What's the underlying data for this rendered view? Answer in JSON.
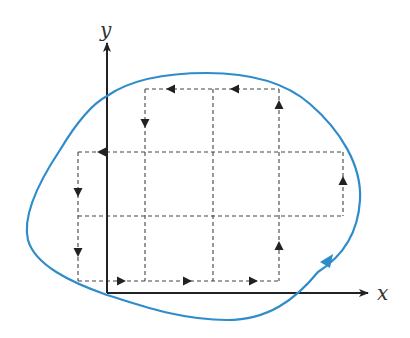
{
  "diagram": {
    "type": "closed-curve-with-grid-circulation",
    "colors": {
      "curve": "#2e8ccb",
      "axes": "#222222",
      "grid": "#444444",
      "arrows": "#222222",
      "background": "#ffffff"
    },
    "axes": {
      "x_label": "x",
      "y_label": "y",
      "origin": [
        107,
        293
      ],
      "x_end": [
        368,
        293
      ],
      "y_end": [
        107,
        43
      ]
    },
    "grid": {
      "x_lines": [
        78,
        145,
        213,
        279,
        343
      ],
      "y_lines": [
        89,
        152,
        216,
        281
      ],
      "cells": [
        {
          "col": 1,
          "row": 0
        },
        {
          "col": 2,
          "row": 0
        },
        {
          "col": 0,
          "row": 1
        },
        {
          "col": 1,
          "row": 1
        },
        {
          "col": 2,
          "row": 1
        },
        {
          "col": 3,
          "row": 1
        },
        {
          "col": 0,
          "row": 2
        },
        {
          "col": 1,
          "row": 2
        },
        {
          "col": 2,
          "row": 2
        },
        {
          "col": 0,
          "row": 3
        },
        {
          "col": 1,
          "row": 3
        },
        {
          "col": 2,
          "row": 3
        }
      ],
      "boundary_arrows": [
        {
          "x": 172,
          "y": 89,
          "dir": "left"
        },
        {
          "x": 236,
          "y": 89,
          "dir": "left"
        },
        {
          "x": 145,
          "y": 122,
          "dir": "down"
        },
        {
          "x": 279,
          "y": 105,
          "dir": "up"
        },
        {
          "x": 102,
          "y": 152,
          "dir": "left"
        },
        {
          "x": 78,
          "y": 192,
          "dir": "down"
        },
        {
          "x": 78,
          "y": 252,
          "dir": "down"
        },
        {
          "x": 343,
          "y": 181,
          "dir": "up"
        },
        {
          "x": 120,
          "y": 281,
          "dir": "right"
        },
        {
          "x": 187,
          "y": 281,
          "dir": "right"
        },
        {
          "x": 253,
          "y": 281,
          "dir": "right"
        },
        {
          "x": 279,
          "y": 246,
          "dir": "up"
        }
      ]
    },
    "curve": {
      "orientation": "counterclockwise",
      "arrow_position": [
        327,
        261
      ]
    }
  }
}
